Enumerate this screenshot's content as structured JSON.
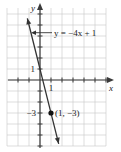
{
  "chart_data": {
    "type": "line",
    "title": "",
    "xlabel": "x",
    "ylabel": "y",
    "xlim": [
      -3,
      6
    ],
    "ylim": [
      -6,
      6.5
    ],
    "grid": true,
    "series": [
      {
        "name": "y = -4x + 1",
        "slope": -4,
        "intercept": 1,
        "x": [
          -1.15,
          1.7
        ],
        "y": [
          5.6,
          -5.8
        ]
      }
    ],
    "annotations": [
      {
        "text": "y = −4x + 1",
        "points_to": "line"
      },
      {
        "text": "(1, −3)",
        "x": 1,
        "y": -3,
        "marker": "point"
      }
    ],
    "tick_labels": {
      "x": [
        "1"
      ],
      "y": [
        "1",
        "−3"
      ]
    }
  }
}
